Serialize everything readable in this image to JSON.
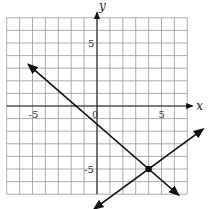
{
  "chart_data": {
    "type": "line",
    "title": "",
    "xlabel": "x",
    "ylabel": "y",
    "xlim": [
      -7,
      7
    ],
    "ylim": [
      -7,
      7
    ],
    "grid": true,
    "grid_step": 1,
    "x_ticks": [
      {
        "value": -5,
        "label": "-5"
      },
      {
        "value": 0,
        "label": "0"
      },
      {
        "value": 5,
        "label": "5"
      }
    ],
    "y_ticks": [
      {
        "value": 5,
        "label": "5"
      },
      {
        "value": -5,
        "label": "-5"
      }
    ],
    "series": [
      {
        "name": "line-decreasing",
        "slope": -0.8889,
        "intercept": -1.4444,
        "x_range": [
          -5.3,
          6.3
        ],
        "arrows": "both"
      },
      {
        "name": "line-increasing",
        "slope": 0.75,
        "intercept": -8,
        "x_range": [
          -0.2,
          8.2
        ],
        "arrows": "both"
      }
    ],
    "points": [
      {
        "name": "intersection",
        "x": 4,
        "y": -5
      }
    ]
  }
}
